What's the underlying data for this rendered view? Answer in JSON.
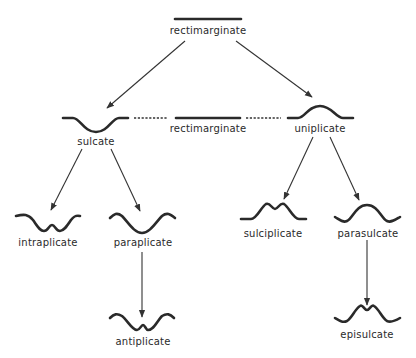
{
  "diagram": {
    "nodes": {
      "rectimarginate_top": {
        "label": "rectimarginate"
      },
      "sulcate": {
        "label": "sulcate"
      },
      "rectimarginate_mid": {
        "label": "rectimarginate"
      },
      "uniplicate": {
        "label": "uniplicate"
      },
      "intraplicate": {
        "label": "intraplicate"
      },
      "paraplicate": {
        "label": "paraplicate"
      },
      "sulciplicate": {
        "label": "sulciplicate"
      },
      "parasulcate": {
        "label": "parasulcate"
      },
      "antiplicate": {
        "label": "antiplicate"
      },
      "episulcate": {
        "label": "episulcate"
      }
    },
    "edges": [
      {
        "from": "rectimarginate_top",
        "to": "sulcate",
        "style": "arrow"
      },
      {
        "from": "rectimarginate_top",
        "to": "uniplicate",
        "style": "arrow"
      },
      {
        "from": "sulcate",
        "to": "rectimarginate_mid",
        "style": "dashed"
      },
      {
        "from": "rectimarginate_mid",
        "to": "uniplicate",
        "style": "dashed"
      },
      {
        "from": "sulcate",
        "to": "intraplicate",
        "style": "arrow"
      },
      {
        "from": "sulcate",
        "to": "paraplicate",
        "style": "arrow"
      },
      {
        "from": "uniplicate",
        "to": "sulciplicate",
        "style": "arrow"
      },
      {
        "from": "uniplicate",
        "to": "parasulcate",
        "style": "arrow"
      },
      {
        "from": "paraplicate",
        "to": "antiplicate",
        "style": "arrow"
      },
      {
        "from": "parasulcate",
        "to": "episulcate",
        "style": "arrow"
      }
    ],
    "colors": {
      "ink": "#2a2a2a",
      "background": "#ffffff"
    }
  }
}
